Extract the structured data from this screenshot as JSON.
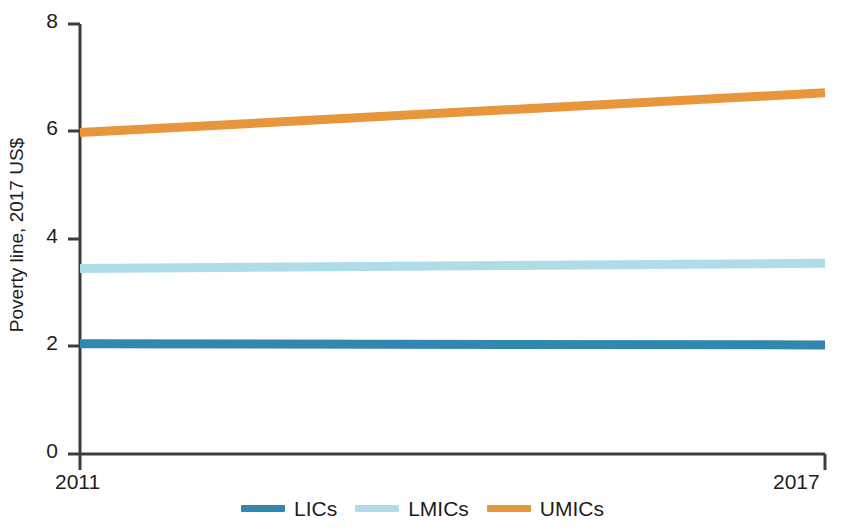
{
  "chart_data": {
    "type": "line",
    "title": "",
    "subtitle": "",
    "xlabel": "",
    "ylabel": "Poverty line, 2017 US$",
    "x": [
      2011,
      2017
    ],
    "xlim": [
      2011,
      2017
    ],
    "ylim": [
      0,
      8
    ],
    "xticks": [
      "2011",
      "2017"
    ],
    "yticks": [
      "0",
      "2",
      "4",
      "6",
      "8"
    ],
    "ytick_values": [
      0,
      2,
      4,
      6,
      8
    ],
    "grid": false,
    "legend_position": "bottom-center",
    "series": [
      {
        "name": "LICs",
        "color": "#3287ae",
        "values": [
          2.05,
          2.03
        ],
        "x": [
          2011,
          2017
        ]
      },
      {
        "name": "LMICs",
        "color": "#aedde8",
        "values": [
          3.45,
          3.55
        ],
        "x": [
          2011,
          2017
        ]
      },
      {
        "name": "UMICs",
        "color": "#e8963c",
        "values": [
          5.98,
          6.72
        ],
        "x": [
          2011,
          2017
        ]
      }
    ]
  },
  "axis": {
    "ylabel": "Poverty line, 2017 US$",
    "ytick_0": "0",
    "ytick_1": "2",
    "ytick_2": "4",
    "ytick_3": "6",
    "ytick_4": "8",
    "xtick_left": "2011",
    "xtick_right": "2017"
  },
  "legend": {
    "items": [
      {
        "label": "LICs",
        "color": "#3287ae"
      },
      {
        "label": "LMICs",
        "color": "#aedde8"
      },
      {
        "label": "UMICs",
        "color": "#e8963c"
      }
    ]
  },
  "colors": {
    "axis": "#3d3d3d",
    "text": "#1d1d1d",
    "background": "#ffffff",
    "lic": "#3287ae",
    "lmic": "#aedde8",
    "umic": "#e8963c"
  }
}
